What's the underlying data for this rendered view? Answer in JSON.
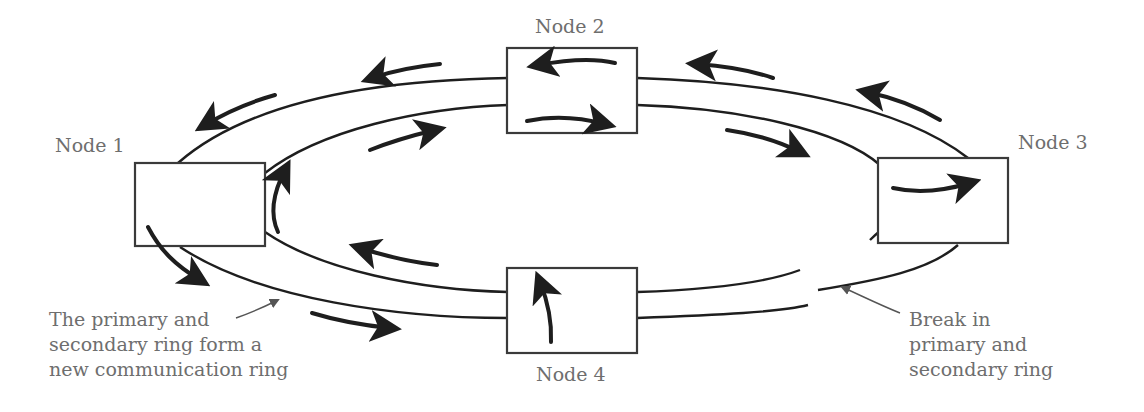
{
  "diagram": {
    "nodes": [
      {
        "id": "node1",
        "label": "Node 1"
      },
      {
        "id": "node2",
        "label": "Node 2"
      },
      {
        "id": "node3",
        "label": "Node 3"
      },
      {
        "id": "node4",
        "label": "Node 4"
      }
    ],
    "annotations": {
      "new_ring": {
        "lines": [
          "The primary and",
          "secondary ring form a",
          "new communication ring"
        ]
      },
      "break": {
        "lines": [
          "Break in",
          "primary and",
          "secondary ring"
        ]
      }
    },
    "colors": {
      "line": "#1e1e1e",
      "box_border": "#3a3a3a",
      "label_text": "#6e6e6e",
      "background": "#ffffff"
    }
  }
}
